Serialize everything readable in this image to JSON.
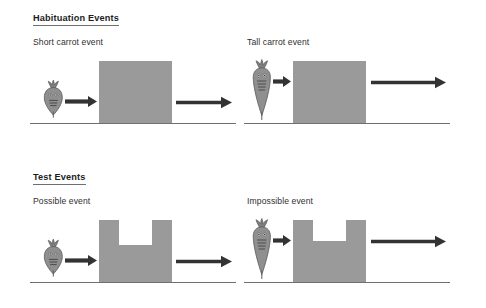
{
  "figure": {
    "background_color": "#ffffff",
    "palette": {
      "screen_gray": "#9a9a9a",
      "carrot_gray": "#8f8f8f",
      "carrot_outline": "#5a5a5a",
      "arrow_dark": "#333333",
      "ground_line": "#6f6f6f",
      "heading_text": "#1d1d1d",
      "caption_text": "#2f2f2f"
    }
  },
  "sections": [
    {
      "id": "habituation",
      "heading": "Habituation Events",
      "panels": [
        {
          "id": "short-carrot",
          "caption": "Short carrot event",
          "carrot": {
            "height_class": "short",
            "label": "short-carrot-figure"
          },
          "screen": {
            "shape": "solid-rectangle",
            "notch": false
          },
          "arrows": [
            "small-right-arrow",
            "large-right-arrow"
          ],
          "ground": "ground-line"
        },
        {
          "id": "tall-carrot",
          "caption": "Tall carrot event",
          "carrot": {
            "height_class": "tall",
            "label": "tall-carrot-figure"
          },
          "screen": {
            "shape": "solid-rectangle",
            "notch": false
          },
          "arrows": [
            "small-right-arrow",
            "large-right-arrow"
          ],
          "ground": "ground-line"
        }
      ]
    },
    {
      "id": "test",
      "heading": "Test Events",
      "panels": [
        {
          "id": "possible",
          "caption": "Possible event",
          "carrot": {
            "height_class": "short",
            "label": "short-carrot-figure"
          },
          "screen": {
            "shape": "notched-rectangle",
            "notch": true,
            "notch_depth": "deep"
          },
          "arrows": [
            "small-right-arrow",
            "large-right-arrow"
          ],
          "ground": "ground-line"
        },
        {
          "id": "impossible",
          "caption": "Impossible event",
          "carrot": {
            "height_class": "tall",
            "label": "tall-carrot-figure"
          },
          "screen": {
            "shape": "notched-rectangle",
            "notch": true,
            "notch_depth": "shallow"
          },
          "arrows": [
            "small-right-arrow",
            "large-right-arrow"
          ],
          "ground": "ground-line"
        }
      ]
    }
  ]
}
